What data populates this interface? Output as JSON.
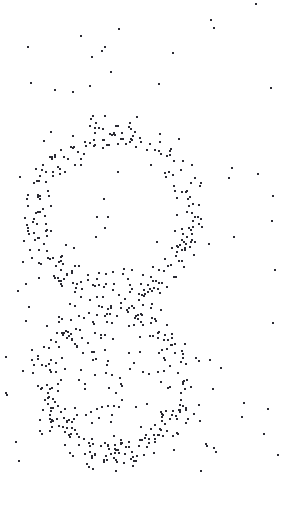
{
  "figure": {
    "width": 285,
    "height": 507,
    "background_color": "#ffffff",
    "dot_color": "#2b2b33",
    "dot_size_px": 2,
    "dot_shape": "square"
  },
  "chart_data": {
    "type": "scatter",
    "subtitle": "",
    "xlabel": "",
    "ylabel": "",
    "xlim": [
      0,
      285
    ],
    "ylim": [
      0,
      507
    ],
    "grid": false,
    "legend": false,
    "axes_visible": false,
    "tick_labels_x": [],
    "tick_labels_y": [],
    "annotations": [],
    "marker": {
      "shape": "square",
      "size_px": 2,
      "color": "#2b2b33",
      "opacity": 1
    },
    "clusters": [
      {
        "name": "upper-ring",
        "shape": "annulus",
        "center": [
          113,
          212
        ],
        "radius": 80,
        "ring_sigma": 9,
        "count": 270,
        "angle_range_deg": [
          0,
          360
        ]
      },
      {
        "name": "lower-ring",
        "shape": "annulus",
        "center": [
          115,
          383
        ],
        "radius": 70,
        "ring_sigma": 9,
        "count": 250,
        "angle_range_deg": [
          0,
          360
        ]
      },
      {
        "name": "lower-interior-fill",
        "shape": "disc",
        "center": [
          115,
          390
        ],
        "radius": 62,
        "count": 48
      },
      {
        "name": "background-noise",
        "shape": "field",
        "count": 110,
        "region": [
          0,
          0,
          285,
          470
        ],
        "density_falloff": "decreases toward top and right edges"
      }
    ],
    "series": [
      {
        "name": "dots",
        "total_points": 678
      }
    ]
  }
}
